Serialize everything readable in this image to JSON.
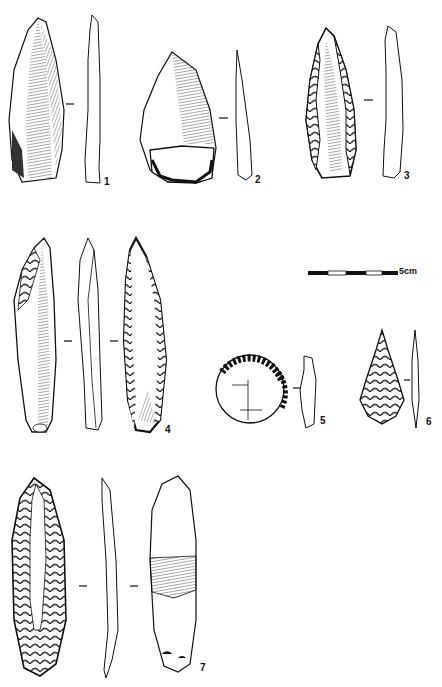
{
  "plate": {
    "description": "Archaeological plate of lithic artifacts (stone tools), ink drawings",
    "ink_color": "#111111",
    "background": "#ffffff"
  },
  "scale_bar": {
    "label": "5cm",
    "segments": 5
  },
  "figures": [
    {
      "number": "1",
      "type": "blade",
      "views": [
        "dorsal",
        "profile"
      ]
    },
    {
      "number": "2",
      "type": "flake",
      "views": [
        "dorsal",
        "profile"
      ]
    },
    {
      "number": "3",
      "type": "retouched point",
      "views": [
        "dorsal",
        "profile"
      ]
    },
    {
      "number": "4",
      "type": "retouched blade",
      "views": [
        "dorsal",
        "profile",
        "ventral"
      ]
    },
    {
      "number": "5",
      "type": "circular scraper",
      "views": [
        "dorsal",
        "profile"
      ]
    },
    {
      "number": "6",
      "type": "leaf point",
      "views": [
        "face",
        "profile"
      ]
    },
    {
      "number": "7",
      "type": "bifacial blade",
      "views": [
        "dorsal",
        "profile",
        "ventral"
      ]
    }
  ],
  "labels": {
    "f1": "1",
    "f2": "2",
    "f3": "3",
    "f4": "4",
    "f5": "5",
    "f6": "6",
    "f7": "7"
  }
}
